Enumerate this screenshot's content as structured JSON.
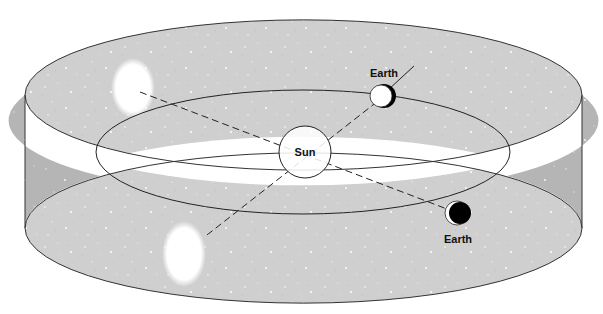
{
  "diagram": {
    "type": "orbital-parallax",
    "colors": {
      "band_fill": "#cfcfcf",
      "band_side_fill": "#b5b5b5",
      "outline": "#333333",
      "background": "#ffffff",
      "star_spot": "#ffffff",
      "earth_night": "#000000"
    },
    "labels": {
      "sun": "Sun",
      "earth_top": "Earth",
      "earth_bottom": "Earth"
    },
    "elements": {
      "star_band": {
        "description": "celestial sphere band with background stars"
      },
      "orbit": {
        "description": "Earth's orbit around the Sun"
      },
      "sun": {
        "cx": 305,
        "cy": 152,
        "r": 26
      },
      "earth_top": {
        "cx": 383,
        "cy": 96,
        "r": 12,
        "phase": "mostly lit, dark crescent on right"
      },
      "earth_bottom": {
        "cx": 457,
        "cy": 213,
        "r": 12,
        "phase": "mostly dark, thin lit crescent on left"
      },
      "apparent_position_upper": {
        "cx": 133,
        "cy": 88,
        "rx": 20,
        "ry": 27
      },
      "apparent_position_lower": {
        "cx": 184,
        "cy": 254,
        "rx": 20,
        "ry": 30
      }
    },
    "sight_lines": [
      {
        "from": "apparent_position_upper",
        "through": "sun",
        "to": "earth_bottom",
        "style": "dashed"
      },
      {
        "from": "apparent_position_lower",
        "through": "sun",
        "to": "earth_top",
        "style": "dashed",
        "extends_solid_beyond": true
      }
    ]
  }
}
